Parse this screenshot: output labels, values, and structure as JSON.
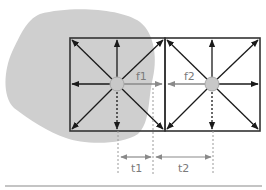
{
  "diagram": {
    "labels": {
      "f1": "f1",
      "f2": "f2",
      "t1": "t1",
      "t2": "t2"
    },
    "colors": {
      "blob": "#cfcfcf",
      "frame": "#333333",
      "arrow": "#1a1a1a",
      "node_fill": "#c8c8c8",
      "node_stroke": "#a8a8a8",
      "dim_arrow": "#9a9a9a",
      "dashed": "#9a9a9a",
      "baseline": "#b0b0b0"
    },
    "cells": [
      {
        "name": "cell-1",
        "x": 70,
        "y": 38,
        "w": 95,
        "h": 93,
        "center": [
          117,
          84
        ]
      },
      {
        "name": "cell-2",
        "x": 165,
        "y": 38,
        "w": 95,
        "h": 93,
        "center": [
          212,
          84
        ]
      }
    ],
    "dimensions": [
      {
        "label": "t1",
        "from_x": 118,
        "to_x": 153,
        "y": 157
      },
      {
        "label": "t2",
        "from_x": 153,
        "to_x": 213,
        "y": 157
      }
    ]
  }
}
